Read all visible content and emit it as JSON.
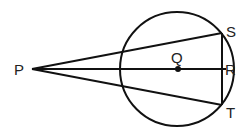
{
  "diagram": {
    "type": "geometry",
    "points": {
      "P": {
        "label": "P",
        "x": 32,
        "y": 69
      },
      "Q": {
        "label": "Q",
        "x": 178,
        "y": 69
      },
      "R": {
        "label": "R",
        "x": 222,
        "y": 69
      },
      "S": {
        "label": "S",
        "x": 222,
        "y": 33
      },
      "T": {
        "label": "T",
        "x": 222,
        "y": 105
      }
    },
    "circle": {
      "center": "Q",
      "cx": 177,
      "cy": 69,
      "r": 57
    },
    "segments": [
      [
        "P",
        "S"
      ],
      [
        "P",
        "R"
      ],
      [
        "P",
        "T"
      ],
      [
        "S",
        "T"
      ]
    ],
    "stroke_color": "#111111"
  }
}
